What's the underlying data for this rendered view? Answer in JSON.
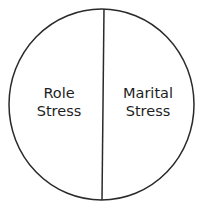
{
  "diagram": {
    "type": "divided-circle",
    "stroke_color": "#2a2a2a",
    "background": "#ffffff",
    "segments": [
      {
        "line1": "Role",
        "line2": "Stress"
      },
      {
        "line1": "Marital",
        "line2": "Stress"
      }
    ]
  }
}
